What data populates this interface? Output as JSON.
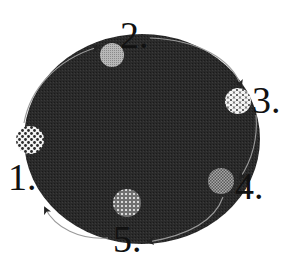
{
  "diagram": {
    "type": "cycle",
    "title": "",
    "background_color": "#ffffff",
    "body": {
      "shape": "ellipse",
      "fill": "#262626",
      "cx": 142,
      "cy": 139,
      "rx": 118,
      "ry": 105
    },
    "nodes": [
      {
        "id": 1,
        "label": "1.",
        "pattern": "bold-dots",
        "cx": 30,
        "cy": 140,
        "r": 14,
        "label_x": 8,
        "label_y": 190
      },
      {
        "id": 2,
        "label": "2.",
        "pattern": "fine-grey",
        "cx": 112,
        "cy": 55,
        "r": 12,
        "label_x": 120,
        "label_y": 48
      },
      {
        "id": 3,
        "label": "3.",
        "pattern": "scales",
        "cx": 238,
        "cy": 101,
        "r": 13,
        "label_x": 252,
        "label_y": 113
      },
      {
        "id": 4,
        "label": "4.",
        "pattern": "checker",
        "cx": 221,
        "cy": 181,
        "r": 13,
        "label_x": 235,
        "label_y": 199
      },
      {
        "id": 5,
        "label": "5.",
        "pattern": "grid",
        "cx": 127,
        "cy": 203,
        "r": 14,
        "label_x": 113,
        "label_y": 252
      }
    ],
    "edges": [
      {
        "from": 1,
        "to": 2,
        "direction": "clockwise"
      },
      {
        "from": 2,
        "to": 3,
        "direction": "clockwise"
      },
      {
        "from": 3,
        "to": 4,
        "direction": "clockwise"
      },
      {
        "from": 4,
        "to": 5,
        "direction": "clockwise"
      },
      {
        "from": 5,
        "to": 1,
        "direction": "clockwise"
      }
    ],
    "colors": {
      "label": "#111111",
      "arrow": "#9a9a9a",
      "node_light": "#f4f4f4",
      "node_dark": "#3a3a3a"
    }
  }
}
